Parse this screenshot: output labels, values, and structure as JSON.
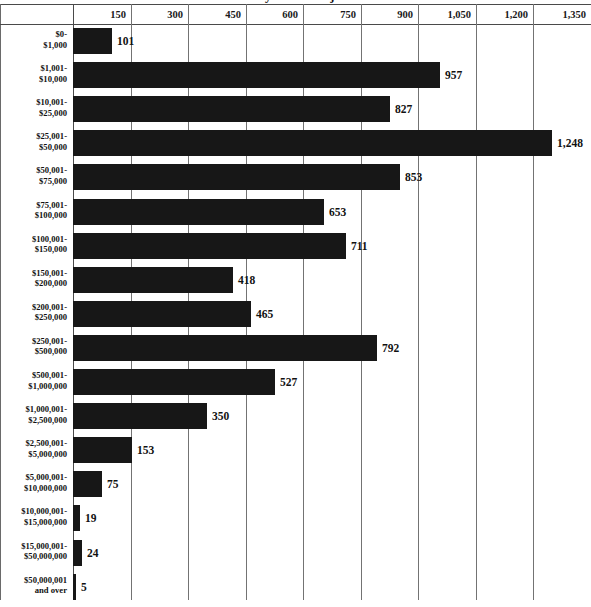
{
  "chart": {
    "title": "Number of Returns by Size of Adjusted Gross Income",
    "value_axis_label": "",
    "category_axis_label": ""
  },
  "chart_data": {
    "type": "bar",
    "orientation": "horizontal",
    "title": "Number of Returns by Size of Adjusted Gross Income",
    "xlabel": "",
    "ylabel": "",
    "xlim": [
      0,
      1350
    ],
    "grid": true,
    "legend": false,
    "tick_labels": [
      "150",
      "300",
      "450",
      "600",
      "750",
      "900",
      "1,050",
      "1,200",
      "1,350"
    ],
    "tick_values": [
      150,
      300,
      450,
      600,
      750,
      900,
      1050,
      1200,
      1350
    ],
    "categories": [
      "$0-\n$1,000",
      "$1,001-\n$10,000",
      "$10,001-\n$25,000",
      "$25,001-\n$50,000",
      "$50,001-\n$75,000",
      "$75,001-\n$100,000",
      "$100,001-\n$150,000",
      "$150,001-\n$200,000",
      "$200,001-\n$250,000",
      "$250,001-\n$500,000",
      "$500,001-\n$1,000,000",
      "$1,000,001-\n$2,500,000",
      "$2,500,001-\n$5,000,000",
      "$5,000,001-\n$10,000,000",
      "$10,000,001-\n$15,000,000",
      "$15,000,001-\n$50,000,000",
      "$50,000,001\nand over"
    ],
    "values": [
      101,
      957,
      827,
      1248,
      853,
      653,
      711,
      418,
      465,
      792,
      527,
      350,
      153,
      75,
      19,
      24,
      5
    ],
    "value_labels": [
      "101",
      "957",
      "827",
      "1,248",
      "853",
      "653",
      "711",
      "418",
      "465",
      "792",
      "527",
      "350",
      "153",
      "75",
      "19",
      "24",
      "5"
    ],
    "bar_color": "#171717",
    "gridline_color": "#737373",
    "background_color": "#ffffff"
  },
  "rows": [
    {
      "line1": "$0-",
      "line2": "$1,000",
      "value_label": "101",
      "value": 101
    },
    {
      "line1": "$1,001-",
      "line2": "$10,000",
      "value_label": "957",
      "value": 957
    },
    {
      "line1": "$10,001-",
      "line2": "$25,000",
      "value_label": "827",
      "value": 827
    },
    {
      "line1": "$25,001-",
      "line2": "$50,000",
      "value_label": "1,248",
      "value": 1248
    },
    {
      "line1": "$50,001-",
      "line2": "$75,000",
      "value_label": "853",
      "value": 853
    },
    {
      "line1": "$75,001-",
      "line2": "$100,000",
      "value_label": "653",
      "value": 653
    },
    {
      "line1": "$100,001-",
      "line2": "$150,000",
      "value_label": "711",
      "value": 711
    },
    {
      "line1": "$150,001-",
      "line2": "$200,000",
      "value_label": "418",
      "value": 418
    },
    {
      "line1": "$200,001-",
      "line2": "$250,000",
      "value_label": "465",
      "value": 465
    },
    {
      "line1": "$250,001-",
      "line2": "$500,000",
      "value_label": "792",
      "value": 792
    },
    {
      "line1": "$500,001-",
      "line2": "$1,000,000",
      "value_label": "527",
      "value": 527
    },
    {
      "line1": "$1,000,001-",
      "line2": "$2,500,000",
      "value_label": "350",
      "value": 350
    },
    {
      "line1": "$2,500,001-",
      "line2": "$5,000,000",
      "value_label": "153",
      "value": 153
    },
    {
      "line1": "$5,000,001-",
      "line2": "$10,000,000",
      "value_label": "75",
      "value": 75
    },
    {
      "line1": "$10,000,001-",
      "line2": "$15,000,000",
      "value_label": "19",
      "value": 19
    },
    {
      "line1": "$15,000,001-",
      "line2": "$50,000,000",
      "value_label": "24",
      "value": 24
    },
    {
      "line1": "$50,000,001",
      "line2": "and over",
      "value_label": "5",
      "value": 5
    }
  ],
  "ticks": [
    {
      "label": "150",
      "value": 150
    },
    {
      "label": "300",
      "value": 300
    },
    {
      "label": "450",
      "value": 450
    },
    {
      "label": "600",
      "value": 600
    },
    {
      "label": "750",
      "value": 750
    },
    {
      "label": "900",
      "value": 900
    },
    {
      "label": "1,050",
      "value": 1050
    },
    {
      "label": "1,200",
      "value": 1200
    },
    {
      "label": "1,350",
      "value": 1350
    }
  ]
}
